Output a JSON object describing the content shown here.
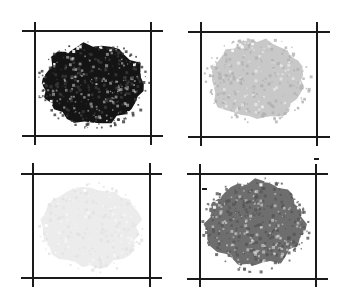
{
  "figure": {
    "layout": "2x2 grid",
    "background": "#ffffff",
    "line_color": "#1a1a1a",
    "panels": [
      {
        "id": "top-left",
        "frame": {
          "x1": 35,
          "x2": 151,
          "y1": 31,
          "y2": 136,
          "ext_x": [
            22,
            163
          ],
          "ext_y": [
            22,
            145
          ]
        },
        "blob": {
          "cx": 93,
          "cy": 84,
          "rx": 53,
          "ry": 41,
          "tone": "#141414",
          "speckle": "#3a3a3a",
          "density": "dense"
        }
      },
      {
        "id": "top-right",
        "frame": {
          "x1": 201,
          "x2": 317,
          "y1": 32,
          "y2": 137,
          "ext_x": [
            188,
            330
          ],
          "ext_y": [
            22,
            146
          ]
        },
        "blob": {
          "cx": 257,
          "cy": 80,
          "rx": 50,
          "ry": 41,
          "tone": "#c8c8c8",
          "speckle": "#b0b0b0",
          "density": "medium"
        }
      },
      {
        "id": "bottom-left",
        "frame": {
          "x1": 33,
          "x2": 150,
          "y1": 174,
          "y2": 278,
          "ext_x": [
            21,
            162
          ],
          "ext_y": [
            163,
            287
          ]
        },
        "blob": {
          "cx": 91,
          "cy": 227,
          "rx": 50,
          "ry": 42,
          "tone": "#ececec",
          "speckle": "#e2e2e2",
          "density": "light"
        }
      },
      {
        "id": "bottom-right",
        "frame": {
          "x1": 200,
          "x2": 316,
          "y1": 174,
          "y2": 279,
          "ext_x": [
            187,
            328
          ],
          "ext_y": [
            164,
            287
          ]
        },
        "blob": {
          "cx": 255,
          "cy": 224,
          "rx": 50,
          "ry": 44,
          "tone": "#6e6e6e",
          "speckle": "#555555",
          "density": "dense"
        }
      }
    ],
    "marks": [
      {
        "x": 314,
        "y": 158,
        "w": 5,
        "h": 2
      },
      {
        "x": 202,
        "y": 188,
        "w": 5,
        "h": 2
      }
    ]
  }
}
